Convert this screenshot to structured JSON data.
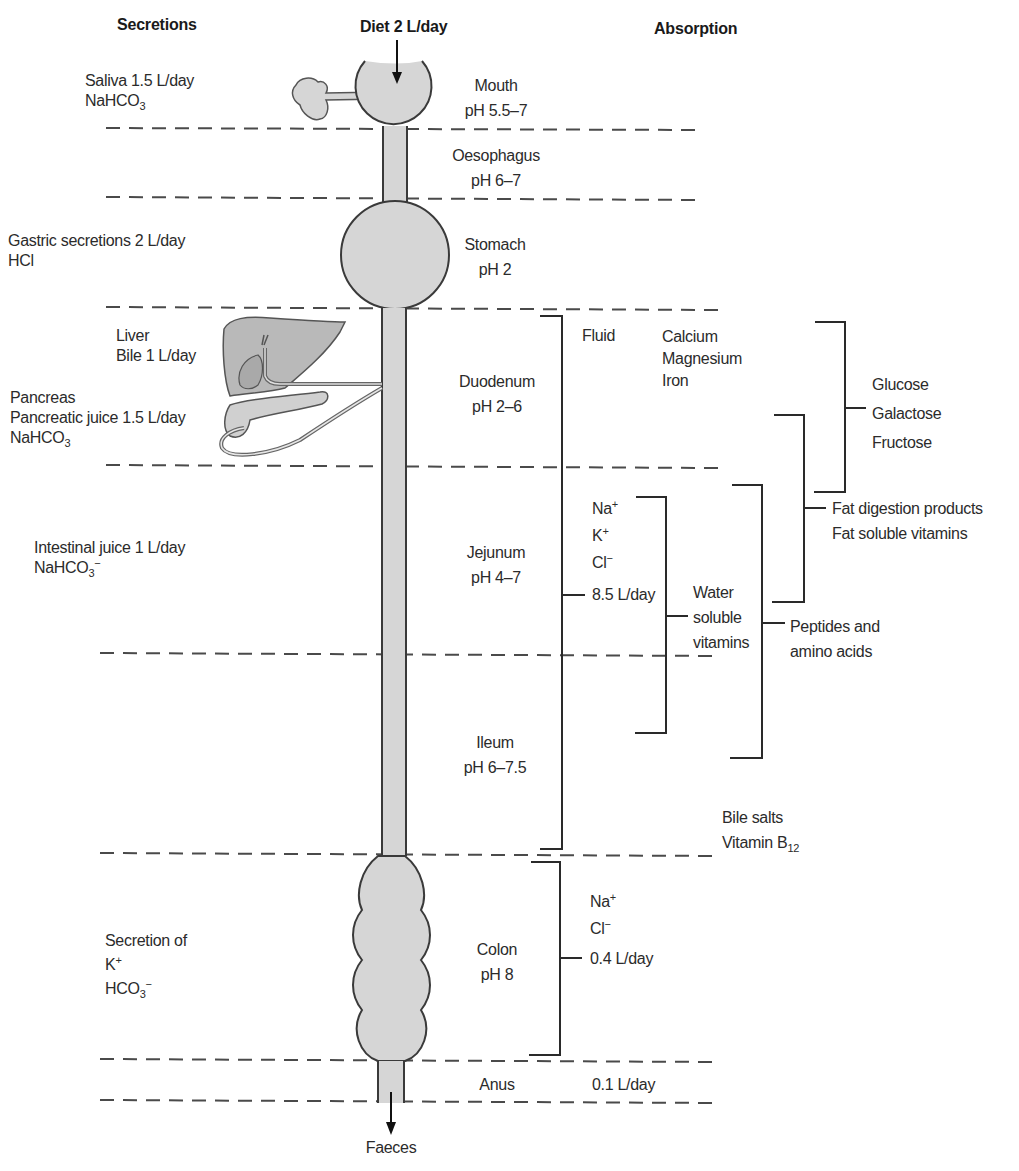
{
  "headers": {
    "secretions": "Secretions",
    "diet": "Diet 2 L/day",
    "absorption": "Absorption"
  },
  "secretions": {
    "saliva": {
      "line1": "Saliva 1.5 L/day",
      "line2_base": "NaHCO",
      "line2_sub": "3"
    },
    "gastric": {
      "line1": "Gastric secretions 2 L/day",
      "line2": "HCl"
    },
    "liver": {
      "line1": "Liver",
      "line2": "Bile 1 L/day"
    },
    "pancreas": {
      "line1": "Pancreas",
      "line2": "Pancreatic juice 1.5 L/day",
      "line3_base": "NaHCO",
      "line3_sub": "3"
    },
    "intestinal": {
      "line1": "Intestinal juice 1 L/day",
      "line2_base": "NaHCO",
      "line2_sub": "3",
      "line2_sup": "−"
    },
    "colon": {
      "line1": "Secretion of",
      "line2_base": "K",
      "line2_sup": "+",
      "line3_base": "HCO",
      "line3_sub": "3",
      "line3_sup": "−"
    }
  },
  "segments": [
    {
      "name": "Mouth",
      "ph": "pH 5.5–7"
    },
    {
      "name": "Oesophagus",
      "ph": "pH 6–7"
    },
    {
      "name": "Stomach",
      "ph": "pH 2"
    },
    {
      "name": "Duodenum",
      "ph": "pH 2–6"
    },
    {
      "name": "Jejunum",
      "ph": "pH 4–7"
    },
    {
      "name": "Ileum",
      "ph": "pH 6–7.5"
    },
    {
      "name": "Colon",
      "ph": "pH 8"
    },
    {
      "name": "Anus",
      "ph": ""
    }
  ],
  "output": {
    "faeces": "Faeces"
  },
  "absorption": {
    "fluid": "Fluid",
    "minerals": [
      "Calcium",
      "Magnesium",
      "Iron"
    ],
    "small_intestine_ions": [
      {
        "base": "Na",
        "sup": "+"
      },
      {
        "base": "K",
        "sup": "+"
      },
      {
        "base": "Cl",
        "sup": "−"
      }
    ],
    "small_intestine_volume": "8.5 L/day",
    "water_soluble_vitamins": [
      "Water",
      "soluble",
      "vitamins"
    ],
    "peptides": [
      "Peptides and",
      "amino acids"
    ],
    "sugars": [
      "Glucose",
      "Galactose",
      "Fructose"
    ],
    "fats": [
      "Fat digestion products",
      "Fat soluble vitamins"
    ],
    "ileum_specific": {
      "line1": "Bile salts",
      "line2_base": "Vitamin B",
      "line2_sub": "12"
    },
    "colon_ions": [
      {
        "base": "Na",
        "sup": "+"
      },
      {
        "base": "Cl",
        "sup": "−"
      }
    ],
    "colon_volume": "0.4 L/day",
    "anus_volume": "0.1 L/day"
  },
  "colors": {
    "organ_fill": "#d6d6d6",
    "organ_stroke": "#3a3a3a",
    "liver_fill": "#b9b9b9",
    "dash": "#4a4a4a",
    "bracket": "#2a2a2a"
  }
}
